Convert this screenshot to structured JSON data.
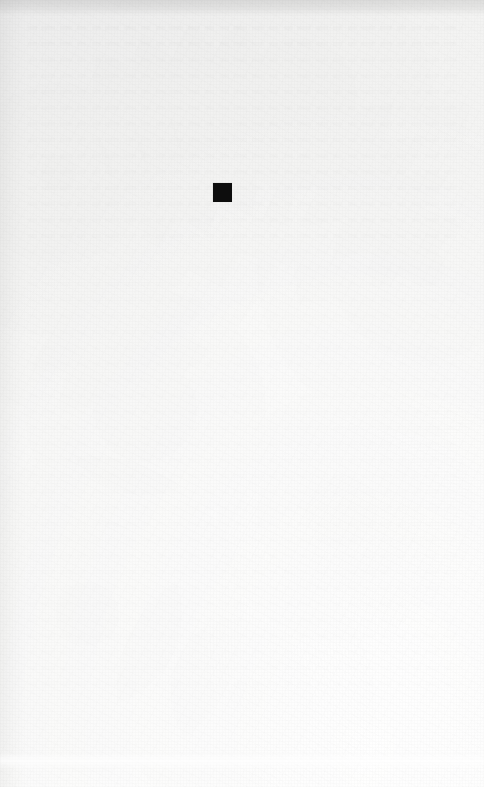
{
  "page": {
    "kind": "scanned-book-page",
    "width_px": 484,
    "height_px": 787,
    "paper_color": "#f6f6f5",
    "paper_highlight_color": "#fafaf9",
    "paper_shadow_color": "#eeeeee",
    "visible_text": "",
    "caption": "",
    "page_number": "",
    "header": "",
    "footer": ""
  },
  "marks": {
    "ink_square": {
      "label": "black filled square",
      "color": "#0d0d0d",
      "x_px": 213,
      "y_px": 183,
      "width_px": 19,
      "height_px": 19
    }
  },
  "artifacts": {
    "top_edge_band": {
      "label": "scanner edge shadow",
      "color": "#d9d9d9",
      "y_px": 0,
      "height_px": 16
    },
    "fold_band": {
      "label": "faint horizontal fold highlight",
      "color": "#ffffff",
      "y_px": 752,
      "height_px": 18
    },
    "bleed_through": {
      "label": "ghost of text from reverse side",
      "color": "#e8e8e6"
    }
  }
}
